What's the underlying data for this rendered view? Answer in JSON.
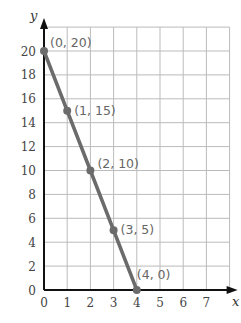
{
  "chart_data": {
    "type": "line",
    "title": "",
    "xlabel": "x",
    "ylabel": "y",
    "xlim": [
      0,
      8
    ],
    "ylim": [
      0,
      22
    ],
    "grid": true,
    "x_ticks": [
      "0",
      "1",
      "2",
      "3",
      "4",
      "5",
      "6",
      "7"
    ],
    "y_ticks": [
      "0",
      "2",
      "4",
      "6",
      "8",
      "10",
      "12",
      "14",
      "16",
      "18",
      "20"
    ],
    "series": [
      {
        "name": "line",
        "x": [
          0,
          1,
          2,
          3,
          4
        ],
        "y": [
          20,
          15,
          10,
          5,
          0
        ],
        "color": "#666666"
      }
    ],
    "annotations": [
      "(0, 20)",
      "(1, 15)",
      "(2, 10)",
      "(3, 5)",
      "(4, 0)"
    ]
  },
  "colors": {
    "grid": "#bbbbbb",
    "axis": "#111111",
    "line": "#6b6b6b",
    "point": "#6b6b6b",
    "label": "#666666"
  }
}
